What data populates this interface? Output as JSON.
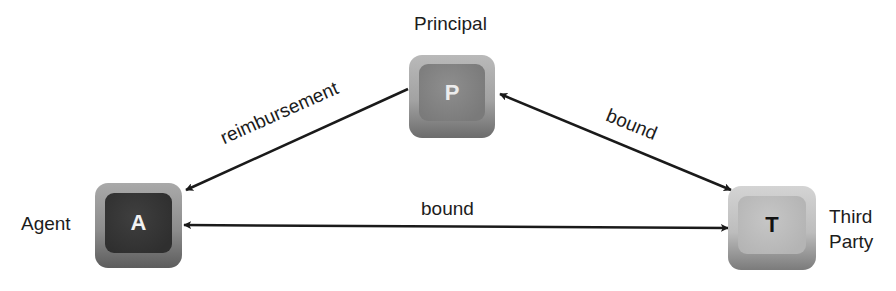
{
  "diagram": {
    "nodes": [
      {
        "id": "P",
        "glyph": "P",
        "label": "Principal"
      },
      {
        "id": "A",
        "glyph": "A",
        "label": "Agent"
      },
      {
        "id": "T",
        "glyph": "T",
        "label_line1": "Third",
        "label_line2": "Party"
      }
    ],
    "edges": [
      {
        "from": "P",
        "to": "A",
        "label": "reimbursement",
        "direction": "one-way"
      },
      {
        "from": "P",
        "to": "T",
        "label": "bound",
        "direction": "two-way"
      },
      {
        "from": "A",
        "to": "T",
        "label": "bound",
        "direction": "two-way"
      }
    ]
  }
}
